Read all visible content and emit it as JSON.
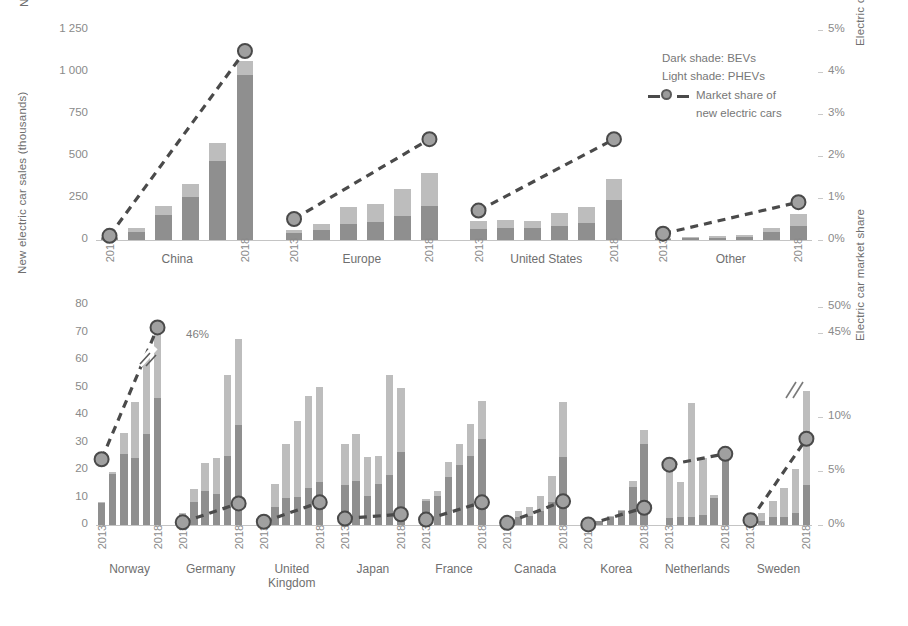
{
  "legend": {
    "dark_shade": "Dark shade: BEVs",
    "light_shade": "Light shade: PHEVs",
    "market_share_line_1": "Market share of",
    "market_share_line_2": "new electric cars"
  },
  "colors": {
    "bev_dark": "#8f8f8f",
    "phev_light": "#bdbdbd",
    "line": "#4a4a4a",
    "marker_fill": "#a0a0a0",
    "marker_stroke": "#4a4a4a",
    "axis": "#c4c4c4",
    "text": "#7a7a7a"
  },
  "chart_data": [
    {
      "id": "top",
      "type": "bar",
      "title": "",
      "ylabel": "New electric car sales (thousands)",
      "y2label": "Electric car market share",
      "xlabel": "",
      "ylim": [
        0,
        1250
      ],
      "y2lim": [
        0,
        5
      ],
      "yticks": [
        "0",
        "250",
        "500",
        "750",
        "1 000",
        "1 250"
      ],
      "y2ticks": [
        "0%",
        "1%",
        "2%",
        "3%",
        "4%",
        "5%"
      ],
      "grid": false,
      "legend_position": "top-right",
      "x": [
        "2013",
        "2014",
        "2015",
        "2016",
        "2017",
        "2018"
      ],
      "groups": [
        {
          "name": "China",
          "first_year": "2013",
          "last_year": "2018",
          "series": [
            {
              "name": "BEV",
              "values": [
                10,
                45,
                147,
                257,
                468,
                984
              ]
            },
            {
              "name": "PHEV",
              "values": [
                5,
                25,
                58,
                78,
                112,
                81
              ]
            }
          ],
          "market_share": [
            0.1,
            null,
            null,
            null,
            null,
            4.5
          ]
        },
        {
          "name": "Europe",
          "first_year": "2013",
          "last_year": "2018",
          "series": [
            {
              "name": "BEV",
              "values": [
                40,
                62,
                95,
                105,
                142,
                204
              ]
            },
            {
              "name": "PHEV",
              "values": [
                18,
                35,
                102,
                110,
                160,
                192
              ]
            }
          ],
          "market_share": [
            0.5,
            null,
            null,
            null,
            null,
            2.4
          ]
        },
        {
          "name": "United States",
          "first_year": "2013",
          "last_year": "2018",
          "series": [
            {
              "name": "BEV",
              "values": [
                63,
                71,
                71,
                86,
                104,
                239
              ]
            },
            {
              "name": "PHEV",
              "values": [
                49,
                47,
                43,
                73,
                95,
                122
              ]
            }
          ],
          "market_share": [
            0.7,
            null,
            null,
            null,
            null,
            2.4
          ]
        },
        {
          "name": "Other",
          "first_year": "2013",
          "last_year": "2018",
          "series": [
            {
              "name": "BEV",
              "values": [
                6,
                10,
                13,
                18,
                46,
                82
              ]
            },
            {
              "name": "PHEV",
              "values": [
                6,
                8,
                10,
                14,
                27,
                70
              ]
            }
          ],
          "market_share": [
            0.15,
            null,
            null,
            null,
            null,
            0.9
          ]
        }
      ]
    },
    {
      "id": "bottom",
      "type": "bar",
      "title": "",
      "ylabel": "New electric car sales (thousands)",
      "y2label": "Electric car market share",
      "xlabel": "",
      "ylim": [
        0,
        80
      ],
      "yticks": [
        "0",
        "10",
        "20",
        "30",
        "40",
        "50",
        "60",
        "70",
        "80"
      ],
      "y2ticks": [
        "0%",
        "5%",
        "10%",
        "45%",
        "50%"
      ],
      "y2_axis_break": true,
      "grid": false,
      "annotation": "46%",
      "x": [
        "2013",
        "2014",
        "2015",
        "2016",
        "2017",
        "2018"
      ],
      "groups": [
        {
          "name": "Norway",
          "first_year": "2013",
          "last_year": "2018",
          "series": [
            {
              "name": "BEV",
              "values": [
                7.9,
                18.6,
                25.8,
                24.2,
                33.0,
                46.1
              ]
            },
            {
              "name": "PHEV",
              "values": [
                0.3,
                0.7,
                7.7,
                20.7,
                28.8,
                26.1
              ]
            }
          ],
          "market_share": [
            6.1,
            null,
            null,
            null,
            null,
            46.0
          ]
        },
        {
          "name": "Germany",
          "first_year": "2013",
          "last_year": "2018",
          "series": [
            {
              "name": "BEV",
              "values": [
                2.8,
                8.5,
                12.4,
                11.3,
                25.1,
                36.2
              ]
            },
            {
              "name": "PHEV",
              "values": [
                1.5,
                4.5,
                10.0,
                13.0,
                29.3,
                31.4
              ]
            }
          ],
          "market_share": [
            0.25,
            null,
            null,
            null,
            null,
            2.0
          ]
        },
        {
          "name": "United Kingdom",
          "first_year": "2013",
          "last_year": "2018",
          "series": [
            {
              "name": "BEV",
              "values": [
                2.5,
                6.7,
                9.9,
                10.3,
                13.6,
                15.5
              ]
            },
            {
              "name": "PHEV",
              "values": [
                0.3,
                8.1,
                19.5,
                27.7,
                33.3,
                34.7
              ]
            }
          ],
          "market_share": [
            0.3,
            null,
            null,
            null,
            null,
            2.1
          ]
        },
        {
          "name": "Japan",
          "first_year": "2013",
          "last_year": "2018",
          "series": [
            {
              "name": "BEV",
              "values": [
                14.5,
                16.1,
                10.4,
                15.0,
                18.1,
                26.5
              ]
            },
            {
              "name": "PHEV",
              "values": [
                15.0,
                17.0,
                14.5,
                10.0,
                36.5,
                23.5
              ]
            }
          ],
          "market_share": [
            0.6,
            null,
            null,
            null,
            null,
            1.0
          ]
        },
        {
          "name": "France",
          "first_year": "2013",
          "last_year": "2018",
          "series": [
            {
              "name": "BEV",
              "values": [
                8.8,
                10.6,
                17.3,
                21.8,
                25.0,
                31.1
              ]
            },
            {
              "name": "PHEV",
              "values": [
                0.5,
                1.9,
                5.7,
                7.6,
                11.9,
                14.1
              ]
            }
          ],
          "market_share": [
            0.5,
            null,
            null,
            null,
            null,
            2.1
          ]
        },
        {
          "name": "Canada",
          "first_year": "2013",
          "last_year": "2018",
          "series": [
            {
              "name": "BEV",
              "values": [
                1.5,
                2.8,
                3.4,
                5.2,
                8.4,
                24.7
              ]
            },
            {
              "name": "PHEV",
              "values": [
                1.4,
                2.3,
                3.1,
                5.2,
                9.5,
                20.2
              ]
            }
          ],
          "market_share": [
            0.2,
            null,
            null,
            null,
            null,
            2.2
          ]
        },
        {
          "name": "Korea",
          "first_year": "2013",
          "last_year": "2018",
          "series": [
            {
              "name": "BEV",
              "values": [
                0.8,
                1.3,
                2.9,
                5.1,
                13.8,
                29.6
              ]
            },
            {
              "name": "PHEV",
              "values": [
                0.0,
                0.1,
                0.2,
                0.2,
                2.3,
                4.9
              ]
            }
          ],
          "market_share": [
            0.05,
            null,
            null,
            null,
            null,
            1.6
          ]
        },
        {
          "name": "Netherlands",
          "first_year": "2013",
          "last_year": "2018",
          "series": [
            {
              "name": "BEV",
              "values": [
                2.6,
                3.0,
                2.9,
                3.7,
                9.9,
                24.5
              ]
            },
            {
              "name": "PHEV",
              "values": [
                19.9,
                12.8,
                41.3,
                20.7,
                0.9,
                3.1
              ]
            }
          ],
          "market_share": [
            5.6,
            null,
            null,
            null,
            null,
            6.6
          ]
        },
        {
          "name": "Sweden",
          "first_year": "2013",
          "last_year": "2018",
          "series": [
            {
              "name": "BEV",
              "values": [
                0.5,
                1.3,
                2.9,
                2.9,
                4.3,
                14.4
              ]
            },
            {
              "name": "PHEV",
              "values": [
                0.4,
                3.0,
                5.8,
                10.4,
                16.0,
                34.3
              ]
            }
          ],
          "market_share": [
            0.45,
            null,
            null,
            null,
            null,
            8.0
          ]
        }
      ]
    }
  ]
}
